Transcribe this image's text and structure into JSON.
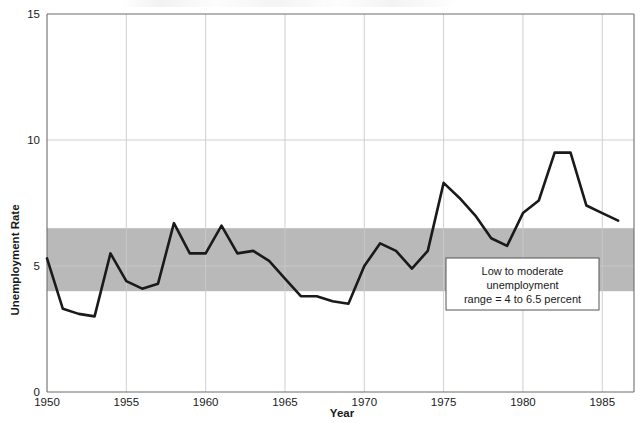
{
  "chart_data": {
    "type": "line",
    "title": "",
    "xlabel": "Year",
    "ylabel": "Unemployment Rate",
    "xlim": [
      1950,
      1987
    ],
    "ylim": [
      0,
      15
    ],
    "xticks": [
      1950,
      1955,
      1960,
      1965,
      1970,
      1975,
      1980,
      1985
    ],
    "xtick_labels": [
      "1950",
      "1955",
      "1960",
      "1965",
      "1970",
      "1975",
      "1980",
      "1985"
    ],
    "yticks": [
      0,
      5,
      10,
      15
    ],
    "ytick_labels": [
      "0",
      "5",
      "10",
      "15"
    ],
    "grid": true,
    "legend": "none",
    "band": {
      "label": "Low to moderate unemployment range",
      "ymin": 4.0,
      "ymax": 6.5,
      "color": "#b9b9b9"
    },
    "line_color": "#1a1a1a",
    "x": [
      1950,
      1951,
      1952,
      1953,
      1954,
      1955,
      1956,
      1957,
      1958,
      1959,
      1960,
      1961,
      1962,
      1963,
      1964,
      1965,
      1966,
      1967,
      1968,
      1969,
      1970,
      1971,
      1972,
      1973,
      1974,
      1975,
      1976,
      1977,
      1978,
      1979,
      1980,
      1981,
      1982,
      1983,
      1984,
      1985,
      1986
    ],
    "series": [
      {
        "name": "Unemployment Rate",
        "values": [
          5.3,
          3.3,
          3.1,
          3.0,
          5.5,
          4.4,
          4.1,
          4.3,
          6.7,
          5.5,
          5.5,
          6.6,
          5.5,
          5.6,
          5.2,
          4.5,
          3.8,
          3.8,
          3.6,
          3.5,
          5.0,
          5.9,
          5.6,
          4.9,
          5.6,
          8.3,
          7.7,
          7.0,
          6.1,
          5.8,
          7.1,
          7.6,
          9.5,
          9.5,
          7.4,
          7.1,
          6.8
        ]
      }
    ],
    "annotation": {
      "lines": [
        "Low to moderate",
        "unemployment",
        "range = 4 to 6.5 percent"
      ],
      "x": 1976.0,
      "y": 4.6
    }
  }
}
